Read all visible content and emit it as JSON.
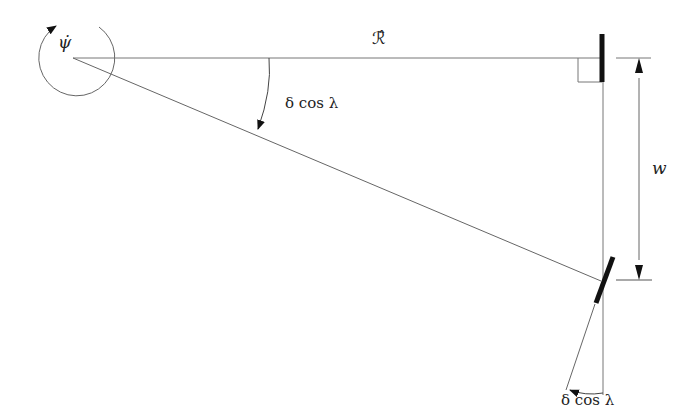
{
  "diagram": {
    "labels": {
      "psi_dot": "ψ̇",
      "r_hat": "ℛ̂",
      "angle_top": "δ cos λ",
      "width": "w",
      "angle_bottom": "δ cos λ"
    },
    "colors": {
      "line": "#555555",
      "bar": "#111111",
      "text": "#222222"
    }
  }
}
